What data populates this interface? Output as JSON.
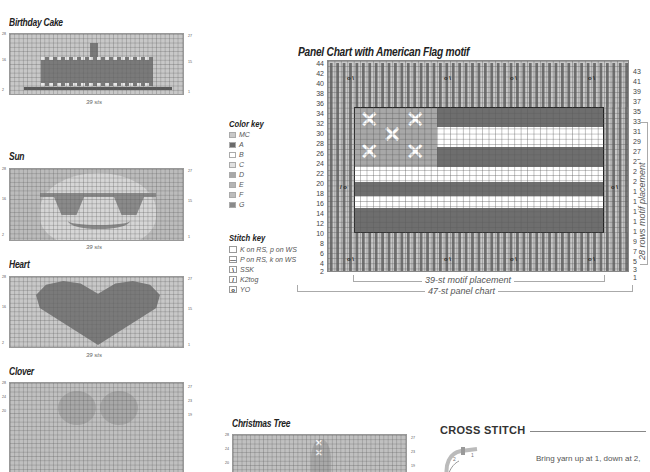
{
  "colors": {
    "MC": "#c8c8c8",
    "A": "#6a6a6a",
    "B": "#ffffff",
    "C": "#e0e0e0",
    "D": "#a8a8a8",
    "E": "#b4b4b4",
    "F": "#bcbcbc",
    "G": "#8a8a8a"
  },
  "charts": {
    "birthday_cake": {
      "title": "Birthday Cake",
      "sts": "39 sts",
      "left_rows": [
        "28",
        "26",
        "24",
        "22",
        "20",
        "18",
        "16",
        "14",
        "12",
        "10",
        "8",
        "6",
        "4",
        "2"
      ],
      "right_rows": [
        "27",
        "25",
        "23",
        "21",
        "19",
        "17",
        "15",
        "13",
        "11",
        "9",
        "7",
        "5",
        "3",
        "1"
      ]
    },
    "sun": {
      "title": "Sun",
      "sts": "39 sts",
      "left_rows": [
        "28",
        "26",
        "24",
        "22",
        "20",
        "18",
        "16",
        "14",
        "12",
        "10",
        "8",
        "6",
        "4",
        "2"
      ],
      "right_rows": [
        "27",
        "25",
        "23",
        "21",
        "19",
        "17",
        "15",
        "13",
        "11",
        "9",
        "7",
        "5",
        "3",
        "1"
      ]
    },
    "heart": {
      "title": "Heart",
      "sts": "39 sts",
      "left_rows": [
        "28",
        "26",
        "24",
        "22",
        "20",
        "18",
        "16",
        "14",
        "12",
        "10",
        "8",
        "6",
        "4",
        "2"
      ],
      "right_rows": [
        "27",
        "25",
        "23",
        "21",
        "19",
        "17",
        "15",
        "13",
        "11",
        "9",
        "7",
        "5",
        "3",
        "1"
      ]
    },
    "clover": {
      "title": "Clover",
      "left_rows": [
        "28",
        "26",
        "24",
        "22",
        "20"
      ],
      "right_rows": [
        "27",
        "25",
        "23",
        "21",
        "19"
      ]
    },
    "christmas_tree": {
      "title": "Christmas Tree",
      "left_rows": [
        "28",
        "26",
        "24",
        "22",
        "20"
      ],
      "right_rows": [
        "27",
        "25",
        "23",
        "21",
        "19"
      ]
    }
  },
  "color_key": {
    "heading": "Color key",
    "items": [
      {
        "code": "MC",
        "color": "#c8c8c8"
      },
      {
        "code": "A",
        "color": "#6a6a6a"
      },
      {
        "code": "B",
        "color": "#ffffff"
      },
      {
        "code": "C",
        "color": "#e0e0e0"
      },
      {
        "code": "D",
        "color": "#a8a8a8"
      },
      {
        "code": "E",
        "color": "#b4b4b4"
      },
      {
        "code": "F",
        "color": "#bcbcbc"
      },
      {
        "code": "G",
        "color": "#8a8a8a"
      }
    ]
  },
  "stitch_key": {
    "heading": "Stitch key",
    "items": [
      {
        "symbol": "",
        "label": "K on RS, p on WS"
      },
      {
        "symbol": "—",
        "label": "P on RS, k on WS"
      },
      {
        "symbol": "\\",
        "label": "SSK"
      },
      {
        "symbol": "/",
        "label": "K2tog"
      },
      {
        "symbol": "o",
        "label": "YO"
      }
    ]
  },
  "panel_chart": {
    "title": "Panel Chart with American Flag motif",
    "left_rows": [
      "44",
      "42",
      "40",
      "38",
      "36",
      "34",
      "32",
      "30",
      "28",
      "26",
      "24",
      "22",
      "20",
      "18",
      "16",
      "14",
      "12",
      "10",
      "8",
      "6",
      "4",
      "2"
    ],
    "right_rows": [
      "43",
      "41",
      "39",
      "37",
      "35",
      "33",
      "31",
      "29",
      "27",
      "25",
      "23",
      "21",
      "19",
      "17",
      "15",
      "13",
      "11",
      "9",
      "7",
      "5",
      "3",
      "1"
    ],
    "motif_width_label": "39-st motif placement",
    "panel_width_label": "47-st panel chart",
    "motif_height_label": "28 rows motif placement",
    "yo_ssk": "o \\",
    "k2tog_yo": "/ o"
  },
  "cross_stitch": {
    "heading": "CROSS STITCH",
    "text": "Bring yarn up at 1, down at 2,"
  }
}
